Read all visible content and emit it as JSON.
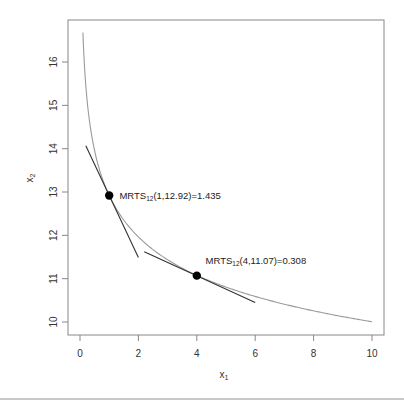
{
  "chart_data": {
    "type": "line",
    "title": "",
    "xlabel": "x",
    "xlabel_sub": "1",
    "ylabel": "x",
    "ylabel_sub": "2",
    "xlim": [
      -0.4,
      10.65
    ],
    "ylim": [
      9.7,
      16.95
    ],
    "xticks": [
      0,
      2,
      4,
      6,
      8,
      10
    ],
    "yticks": [
      10,
      11,
      12,
      13,
      14,
      15,
      16
    ],
    "grid": false,
    "legend": null,
    "series": [
      {
        "name": "isoquant",
        "kind": "curve",
        "formula": "x2 = 12.92 * x1^(-0.111)",
        "A": 12.92,
        "b": 0.111,
        "x_range": [
          0.1,
          10
        ],
        "color": "#9a9a9a",
        "sample_points": [
          {
            "x": 0.1,
            "y": 16.64
          },
          {
            "x": 0.5,
            "y": 13.96
          },
          {
            "x": 1,
            "y": 12.92
          },
          {
            "x": 2,
            "y": 11.96
          },
          {
            "x": 4,
            "y": 11.07
          },
          {
            "x": 6,
            "y": 10.58
          },
          {
            "x": 8,
            "y": 10.25
          },
          {
            "x": 10,
            "y": 10.03
          }
        ]
      },
      {
        "name": "tangent-1",
        "kind": "segment",
        "color": "#333333",
        "points": [
          {
            "x": 0.2,
            "y": 14.07
          },
          {
            "x": 2.0,
            "y": 11.49
          }
        ]
      },
      {
        "name": "tangent-2",
        "kind": "segment",
        "color": "#333333",
        "points": [
          {
            "x": 2.2,
            "y": 11.62
          },
          {
            "x": 6.0,
            "y": 10.45
          }
        ]
      }
    ],
    "points": [
      {
        "x": 1,
        "y": 12.92,
        "mrts": 1.435
      },
      {
        "x": 4,
        "y": 11.07,
        "mrts": 0.308
      }
    ],
    "annotations": [
      {
        "prefix": "MRTS",
        "sub": "12",
        "suffix": "(1,12.92)=1.435",
        "x": 1.35,
        "y": 12.92
      },
      {
        "prefix": "MRTS",
        "sub": "12",
        "suffix": "(4,11.07)=0.308",
        "x": 4.3,
        "y": 11.42
      }
    ]
  }
}
